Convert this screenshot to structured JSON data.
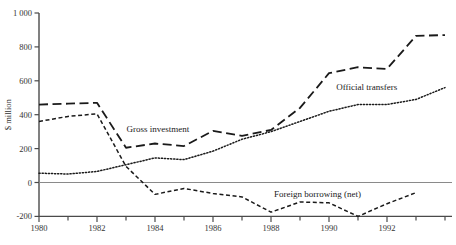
{
  "chart_data": {
    "type": "line",
    "title": "",
    "xlabel": "",
    "ylabel": "$ million",
    "x": [
      1980,
      1981,
      1982,
      1983,
      1984,
      1985,
      1986,
      1987,
      1988,
      1989,
      1990,
      1991,
      1992,
      1993,
      1994
    ],
    "xlim": [
      1980,
      1994
    ],
    "ylim": [
      -200,
      1000
    ],
    "yticks": [
      -200,
      0,
      200,
      400,
      600,
      800,
      1000
    ],
    "ytick_labels": [
      "-200",
      "0",
      "200",
      "400",
      "600",
      "800",
      "1 000"
    ],
    "xticks": [
      1980,
      1981,
      1982,
      1983,
      1984,
      1985,
      1986,
      1987,
      1988,
      1989,
      1990,
      1991,
      1992,
      1993,
      1994
    ],
    "xtick_labels_major": [
      "1980",
      "1982",
      "1984",
      "1986",
      "1988",
      "1990",
      "1992"
    ],
    "xticks_major": [
      1980,
      1982,
      1984,
      1986,
      1988,
      1990,
      1992
    ],
    "grid": false,
    "legend_position": "inline-annotations",
    "zero_reference_line": 0,
    "series": [
      {
        "name": "Gross investment",
        "style": "long-dash",
        "label_x": 1984.1,
        "label_y": 300,
        "values": [
          460,
          465,
          470,
          205,
          230,
          215,
          305,
          275,
          310,
          440,
          645,
          680,
          670,
          865,
          870
        ]
      },
      {
        "name": "Official transfers",
        "style": "dotted",
        "label_x": 1991.3,
        "label_y": 545,
        "values": [
          55,
          50,
          65,
          105,
          145,
          135,
          185,
          255,
          300,
          360,
          420,
          460,
          460,
          490,
          560
        ]
      },
      {
        "name": "Foreign borrowing (net)",
        "style": "short-dash",
        "label_x": 1989.6,
        "label_y": -85,
        "values": [
          360,
          390,
          405,
          95,
          -70,
          -35,
          -65,
          -85,
          -175,
          -115,
          -120,
          -200,
          -125,
          -60,
          null
        ]
      }
    ]
  },
  "colors": {
    "axis": "#4a4a4a",
    "zero_line": "#8a8a8a",
    "series_line": "#1a1a1a",
    "text": "#333333",
    "background": "#ffffff"
  },
  "axis_titles": {
    "y": "$ million"
  }
}
